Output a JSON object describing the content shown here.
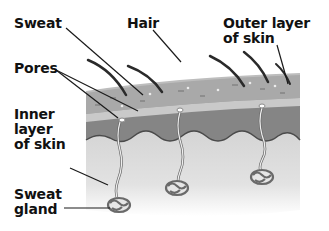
{
  "diagram": {
    "type": "skin-cross-section",
    "labels": {
      "sweat": "Sweat",
      "hair": "Hair",
      "outer_layer": "Outer layer\nof skin",
      "pores": "Pores",
      "inner_layer": "Inner\nlayer\nof skin",
      "sweat_gland": "Sweat\ngland"
    },
    "colors": {
      "outer_layer": "#a8a8a8",
      "outer_band": "#c4c4c4",
      "dark_band": "#7c7c7c",
      "inner_layer": "#d2d2d2",
      "hair": "#2a2a2a",
      "leader_line": "#1a1a1a",
      "text": "#111111"
    }
  }
}
